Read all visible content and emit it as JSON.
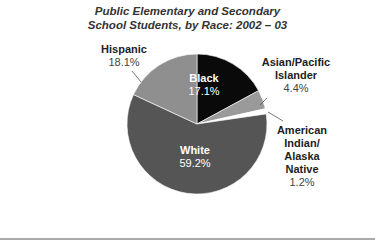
{
  "chart_data": {
    "type": "pie",
    "title_lines": [
      "Public Elementary and Secondary",
      "School Students, by Race: 2002 – 03"
    ],
    "categories": [
      "Black",
      "Asian/Pacific Islander",
      "American Indian/Alaska Native",
      "White",
      "Hispanic"
    ],
    "values": [
      17.1,
      4.4,
      1.2,
      59.2,
      18.1
    ],
    "labels": [
      "17.1%",
      "4.4%",
      "1.2%",
      "59.2%",
      "18.1%"
    ],
    "colors": [
      "#0a0a0a",
      "#9a9a9a",
      "#ffffff",
      "#555555",
      "#8f8f8f"
    ],
    "start_angle": "12 o'clock, clockwise",
    "legend": "none (direct labels)"
  },
  "labels": {
    "black": {
      "name": "Black",
      "pct": "17.1%"
    },
    "asian": {
      "name1": "Asian/Pacific",
      "name2": "Islander",
      "pct": "4.4%"
    },
    "aian": {
      "name1": "American",
      "name2": "Indian/",
      "name3": "Alaska",
      "name4": "Native",
      "pct": "1.2%"
    },
    "white": {
      "name": "White",
      "pct": "59.2%"
    },
    "hispanic": {
      "name": "Hispanic",
      "pct": "18.1%"
    }
  }
}
